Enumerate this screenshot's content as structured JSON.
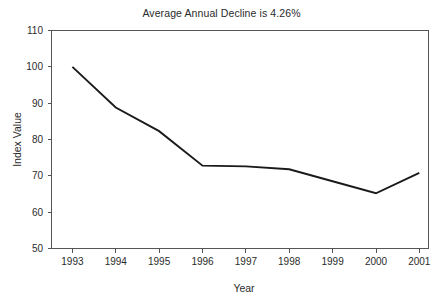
{
  "chart_data": {
    "type": "line",
    "title": "Average Annual Decline is 4.26%",
    "xlabel": "Year",
    "ylabel": "Index Value",
    "categories": [
      "1993",
      "1994",
      "1995",
      "1996",
      "1997",
      "1998",
      "1999",
      "2000",
      "2001"
    ],
    "x": [
      1993,
      1994,
      1995,
      1996,
      1997,
      1998,
      1999,
      2000,
      2001
    ],
    "values": [
      100.0,
      88.8,
      82.3,
      72.8,
      72.6,
      71.8,
      68.5,
      65.2,
      70.8
    ],
    "series": [
      {
        "name": "Index Value",
        "values": [
          100.0,
          88.8,
          82.3,
          72.8,
          72.6,
          71.8,
          68.5,
          65.2,
          70.8
        ]
      }
    ],
    "ylim": [
      50,
      110
    ],
    "ytick_labels": [
      "110",
      "100",
      "90",
      "80",
      "70",
      "60",
      "50"
    ],
    "yticks": [
      110,
      100,
      90,
      80,
      70,
      60,
      50
    ],
    "xtick_labels": [
      "1993",
      "1994",
      "1995",
      "1996",
      "1997",
      "1998",
      "1999",
      "2000",
      "2001"
    ],
    "grid": false,
    "legend": false,
    "legend_position": "none",
    "line_color": "#1a1a1a",
    "axis_color": "#555555",
    "background_color": "#ffffff"
  }
}
